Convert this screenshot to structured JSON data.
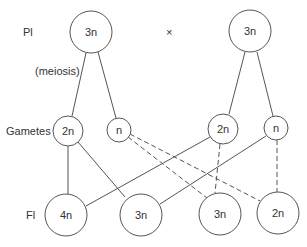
{
  "labels": {
    "p1": "Pl",
    "meiosis": "(meiosis)",
    "gametes": "Gametes",
    "f1": "Fl",
    "cross": "×"
  },
  "nodes": {
    "p1_left": "3n",
    "p1_right": "3n",
    "gamete_left_2n": "2n",
    "gamete_left_n": "n",
    "gamete_right_2n": "2n",
    "gamete_right_n": "n",
    "f1_a": "4n",
    "f1_b": "3n",
    "f1_c": "3n",
    "f1_d": "2n"
  },
  "colors": {
    "stroke": "#555555",
    "text": "#333333",
    "background": "#ffffff"
  }
}
